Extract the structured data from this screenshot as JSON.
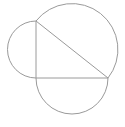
{
  "diagram": {
    "type": "geometry",
    "stroke_color": "#9a9a9a",
    "background": "#ffffff",
    "vertices": {
      "A": {
        "x": 36,
        "y": 21
      },
      "B": {
        "x": 36,
        "y": 78
      },
      "C": {
        "x": 108,
        "y": 78
      }
    },
    "right_angle_at": "B",
    "semicircles": [
      {
        "side": "AB",
        "center": {
          "x": 36,
          "y": 49.5
        },
        "radius": 28.5
      },
      {
        "side": "BC",
        "center": {
          "x": 72,
          "y": 78
        },
        "radius": 36
      },
      {
        "side": "AC",
        "center": {
          "x": 72,
          "y": 49.5
        },
        "radius": 45.9
      }
    ]
  }
}
